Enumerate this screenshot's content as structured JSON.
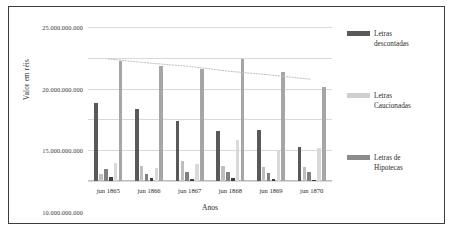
{
  "chart_data": {
    "type": "bar",
    "title": "",
    "xlabel": "Anos",
    "ylabel": "Valor em réis",
    "categories": [
      "jun 1865",
      "jun 1866",
      "jun 1867",
      "jun 1868",
      "jun 1869",
      "jun 1870"
    ],
    "ylim": [
      0,
      25000000000
    ],
    "ytick_values": [
      0,
      5000000000,
      10000000000,
      15000000000,
      20000000000,
      25000000000
    ],
    "ytick_labels": [
      "0",
      "5.000.000.000",
      "10.000.000.000",
      "15.000.000.000",
      "20.000.000.000",
      "25.000.000.000"
    ],
    "grid": true,
    "legend_position": "right",
    "bars_per_group": 6,
    "series": [
      {
        "name": "Letras descontadas",
        "color": "#595959",
        "values": [
          12600000000,
          11700000000,
          9800000000,
          8100000000,
          8250000000,
          5450000000
        ]
      },
      {
        "name": "Letras Caucionadas",
        "color": "#bfbfbf",
        "values": [
          1100000000,
          2400000000,
          3300000000,
          2450000000,
          2250000000,
          2200000000
        ]
      },
      {
        "name": "Letras de Hipotecas",
        "color": "#808080",
        "values": [
          1950000000,
          1150000000,
          1400000000,
          1450000000,
          1300000000,
          1500000000
        ]
      },
      {
        "name": "serie-4",
        "color": "#404040",
        "values": [
          600000000,
          550000000,
          400000000,
          450000000,
          300000000,
          180000000
        ]
      },
      {
        "name": "serie-5",
        "color": "#d9d9d9",
        "values": [
          2900000000,
          2150000000,
          2700000000,
          6600000000,
          5000000000,
          5300000000
        ]
      },
      {
        "name": "serie-6",
        "color": "#a6a6a6",
        "values": [
          19500000000,
          18600000000,
          18150000000,
          19850000000,
          17700000000,
          15200000000
        ]
      }
    ],
    "trendline": {
      "style": "dotted",
      "color": "#bfbfbf",
      "points": [
        19800000000,
        19150000000,
        18600000000,
        17800000000,
        17200000000,
        16500000000
      ]
    }
  },
  "legend": {
    "items": [
      {
        "label": "Letras\ndescontadas",
        "color": "#595959"
      },
      {
        "label": "Letras\nCaucionadas",
        "color": "#cfcfcf"
      },
      {
        "label": "Letras de\nHipotecas",
        "color": "#8c8c8c"
      }
    ]
  },
  "axes": {
    "x_title": "Anos",
    "y_title": "Valor em réis"
  }
}
